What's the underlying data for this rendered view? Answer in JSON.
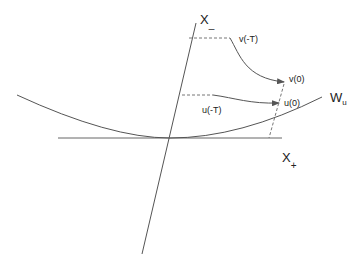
{
  "labels": {
    "x_minus": "X",
    "x_minus_sub": "_",
    "x_plus": "X",
    "x_plus_sub": "+",
    "w_u": "W",
    "w_u_sub": "u",
    "v_minus_t": "v(-T)",
    "v_zero": "v(0)",
    "u_minus_t": "u(-T)",
    "u_zero": "u(0)"
  },
  "colors": {
    "line": "#555555",
    "dashed": "#777777",
    "text": "#222222"
  }
}
